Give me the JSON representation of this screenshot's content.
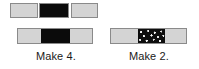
{
  "figure": {
    "type": "bar-model-diagram",
    "background_color": "#ffffff",
    "outline_color": "#8a8a8a",
    "colors": {
      "light": "#d4d4d4",
      "dark": "#0b0b0b",
      "speckled": "#0d0d0d"
    }
  },
  "models": [
    {
      "id": "left-model",
      "caption": "Make 4.",
      "unit_blocks": [
        {
          "id": "unit-a",
          "fill": "light"
        },
        {
          "id": "unit-b",
          "fill": "dark"
        },
        {
          "id": "unit-c",
          "fill": "light"
        }
      ],
      "bar": {
        "id": "bar-left",
        "segments": [
          {
            "index": 1,
            "fill": "light"
          },
          {
            "index": 2,
            "fill": "dark"
          },
          {
            "index": 3,
            "fill": "light"
          }
        ]
      }
    },
    {
      "id": "right-model",
      "caption": "Make 2.",
      "unit_blocks": [],
      "bar": {
        "id": "bar-right",
        "segments": [
          {
            "index": 1,
            "fill": "light"
          },
          {
            "index": 2,
            "fill": "speckled"
          },
          {
            "index": 3,
            "fill": "light"
          }
        ]
      }
    }
  ]
}
